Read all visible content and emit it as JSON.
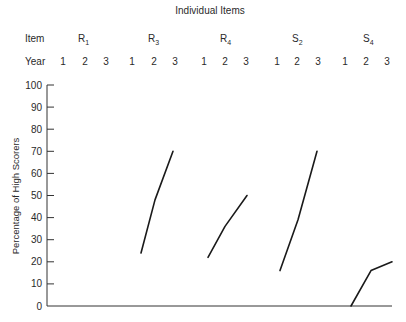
{
  "chart_data": {
    "type": "line",
    "title": "Individual Items",
    "header_row_labels": {
      "item": "Item",
      "year": "Year"
    },
    "ylabel": "Percentage of High Scorers",
    "xlabel": "",
    "ylim": [
      0,
      100
    ],
    "yticks": [
      0,
      10,
      20,
      30,
      40,
      50,
      60,
      70,
      80,
      90,
      100
    ],
    "grid": false,
    "legend": null,
    "categories": [
      "1",
      "2",
      "3"
    ],
    "items": [
      {
        "name": "R",
        "sub": "1",
        "label": "R1",
        "years": [
          "1",
          "2",
          "3"
        ],
        "values": [
          0,
          0,
          0
        ],
        "drawn": false
      },
      {
        "name": "R",
        "sub": "3",
        "label": "R3",
        "years": [
          "1",
          "2",
          "3"
        ],
        "values": [
          24,
          48,
          70
        ],
        "drawn": true
      },
      {
        "name": "R",
        "sub": "4",
        "label": "R4",
        "years": [
          "1",
          "2",
          "3"
        ],
        "values": [
          22,
          36,
          50
        ],
        "drawn": true
      },
      {
        "name": "S",
        "sub": "2",
        "label": "S2",
        "years": [
          "1",
          "2",
          "3"
        ],
        "values": [
          16,
          39,
          70
        ],
        "drawn": true
      },
      {
        "name": "S",
        "sub": "4",
        "label": "S4",
        "years": [
          "1",
          "2",
          "3"
        ],
        "values": [
          0,
          16,
          20
        ],
        "drawn": true
      }
    ],
    "series": [
      {
        "name": "R1",
        "values": [
          0,
          0,
          0
        ]
      },
      {
        "name": "R3",
        "values": [
          24,
          48,
          70
        ]
      },
      {
        "name": "R4",
        "values": [
          22,
          36,
          50
        ]
      },
      {
        "name": "S2",
        "values": [
          16,
          39,
          70
        ]
      },
      {
        "name": "S4",
        "values": [
          0,
          16,
          20
        ]
      }
    ]
  },
  "layout": {
    "item_label_x": [
      78,
      148,
      220,
      292,
      363
    ],
    "year_x": [
      [
        63,
        85,
        106
      ],
      [
        141,
        155,
        173
      ],
      [
        208,
        225,
        247
      ],
      [
        280,
        298,
        317
      ],
      [
        351,
        371,
        392
      ]
    ],
    "year_label_x": [
      [
        63,
        85,
        106
      ],
      [
        132,
        154,
        175
      ],
      [
        204,
        225,
        246
      ],
      [
        277,
        297,
        318
      ],
      [
        345,
        366,
        387
      ]
    ],
    "plot": {
      "x0": 47,
      "x1": 392,
      "y0": 306,
      "y100": 85
    }
  }
}
